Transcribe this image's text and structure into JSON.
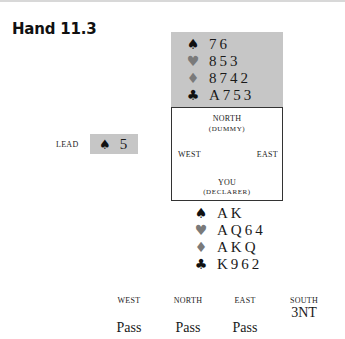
{
  "heading": "Hand 11.3",
  "dummy": {
    "rows": [
      {
        "suit_icon": "♠",
        "suit": "spades",
        "cards": "76"
      },
      {
        "suit_icon": "♥",
        "suit": "hearts",
        "cards": "853"
      },
      {
        "suit_icon": "♦",
        "suit": "diamonds",
        "cards": "8742"
      },
      {
        "suit_icon": "♣",
        "suit": "clubs",
        "cards": "A753"
      }
    ]
  },
  "compass": {
    "north": "NORTH",
    "north_sub": "(DUMMY)",
    "west": "WEST",
    "east": "EAST",
    "south": "YOU",
    "south_sub": "(DECLARER)"
  },
  "lead": {
    "label": "LEAD",
    "suit_icon": "♠",
    "card": "5"
  },
  "declarer": {
    "rows": [
      {
        "suit_icon": "♠",
        "suit": "spades",
        "cards": "AK"
      },
      {
        "suit_icon": "♥",
        "suit": "hearts",
        "cards": "AQ64"
      },
      {
        "suit_icon": "♦",
        "suit": "diamonds",
        "cards": "AKQ"
      },
      {
        "suit_icon": "♣",
        "suit": "clubs",
        "cards": "K962"
      }
    ]
  },
  "auction": {
    "headers": [
      "WEST",
      "NORTH",
      "EAST",
      "SOUTH"
    ],
    "bids": {
      "south_1": "3NT",
      "west_1": "Pass",
      "north_1": "Pass",
      "east_1": "Pass"
    }
  },
  "colors": {
    "box_gray": "#c6c6c6",
    "black_suit": "#111111",
    "red_suit_print": "#7a7a7a"
  }
}
